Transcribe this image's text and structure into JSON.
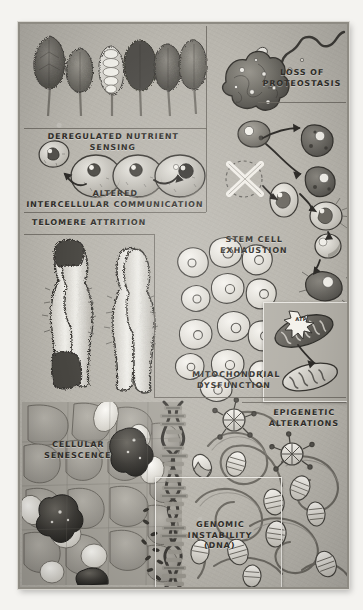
{
  "poster": {
    "title": "Hallmarks of Aging illustration",
    "style": "hand-drawn grayscale scientific poster",
    "background_color": "#b9b6ae",
    "ink_color": "#2f2d29",
    "frame_color": "#8e8b83"
  },
  "panels": [
    {
      "id": "deregulated-nutrient-sensing",
      "label": "DEREGULATED NUTRIENT SENSING",
      "subject": "row of leafy vegetables / broccoli heads",
      "position": "top-left"
    },
    {
      "id": "loss-of-proteostasis",
      "label": "LOSS OF\nPROTEOSTASIS",
      "subject": "misfolded protein blob with unraveling peptide chain",
      "position": "top-right"
    },
    {
      "id": "altered-intercellular-communication",
      "label": "ALTERED\nINTERCELLULAR COMMUNICATION",
      "subject": "chain of cells signalling to one another with arrows",
      "position": "upper-left"
    },
    {
      "id": "stem-cell-exhaustion",
      "label": "STEM CELL\nEXHAUSTION",
      "subject": "crossed-out stem cell with differentiation lineage arrows",
      "position": "upper-right"
    },
    {
      "id": "telomere-attrition",
      "label": "TELOMERE ATTRITION",
      "subject": "two chromosomes, one with dark eroded telomere caps",
      "position": "middle-left"
    },
    {
      "id": "mitochondrial-dysfunction",
      "label": "MITOCHONDRIAL\nDYSFUNCTION",
      "subject": "two mitochondria, one bursting with ATP",
      "position": "middle-right",
      "annotation": "ATP"
    },
    {
      "id": "cellular-senescence",
      "label": "CELLULAR\nSENESCENCE",
      "subject": "micrograph of tissue with dark senescent cells",
      "position": "bottom-left"
    },
    {
      "id": "genomic-instability",
      "label": "GENOMIC\nINSTABILITY\n(DNA)",
      "subject": "fragmenting DNA double helix",
      "position": "bottom-center"
    },
    {
      "id": "epigenetic-alterations",
      "label": "EPIGENETIC\nALTERATIONS",
      "subject": "chromatin fibre with nucleosomes and methyl marks",
      "position": "bottom-right"
    }
  ],
  "annotations": {
    "atp_burst": "ATP"
  }
}
